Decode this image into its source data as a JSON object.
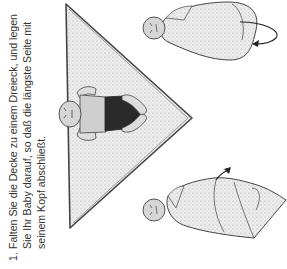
{
  "instruction": {
    "step_number": "1.",
    "text": "Falten Sie die Decke zu einem Dreieck, und legen Sie Ihr Baby darauf, so daß die längste Seite mit seinem Kopf abschließt."
  },
  "illustrations": [
    {
      "name": "baby-on-triangle-blanket",
      "description": "baby lying on blanket folded into a triangle"
    },
    {
      "name": "baby-wrapped-arrow-down",
      "description": "baby partially wrapped with fold arrow"
    },
    {
      "name": "baby-wrapped-arrow-around",
      "description": "baby fully wrapped with curved arrow"
    }
  ],
  "colors": {
    "text": "#333333",
    "outline": "#444444",
    "blanket": "#e6e6e6",
    "shorts": "#2a2a2a",
    "skin": "#d6d6d6"
  }
}
